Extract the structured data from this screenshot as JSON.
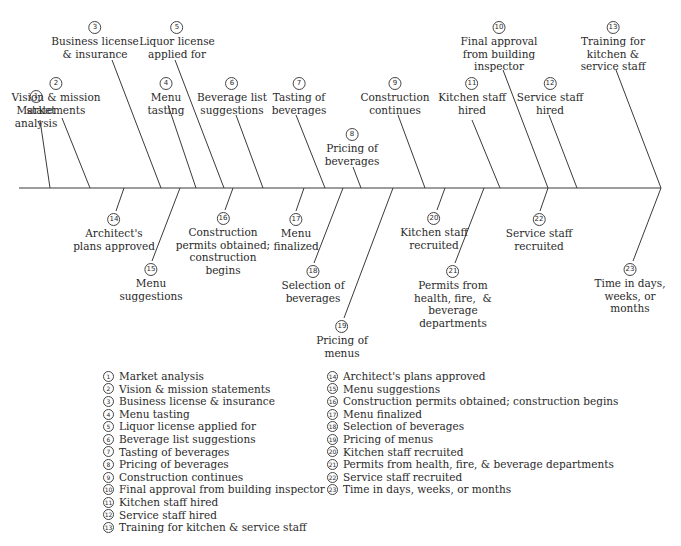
{
  "chart_data": {
    "type": "fishbone-timeline",
    "spine": {
      "x1": 19,
      "x2": 661,
      "y": 188
    },
    "upper_items": [
      {
        "n": "1",
        "label": "Market\nanalysis",
        "lx": 36,
        "ly": 90,
        "x1": 40,
        "y1": 120,
        "x2": 50,
        "y2": 188
      },
      {
        "n": "2",
        "label": "Vision & mission\nstatements",
        "lx": 56,
        "ly": 77,
        "x1": 62,
        "y1": 118,
        "x2": 90,
        "y2": 188
      },
      {
        "n": "3",
        "label": "Business license\n& insurance",
        "lx": 95,
        "ly": 21,
        "x1": 112,
        "y1": 60,
        "x2": 161,
        "y2": 188
      },
      {
        "n": "4",
        "label": "Menu\ntasting",
        "lx": 166,
        "ly": 77,
        "x1": 168,
        "y1": 105,
        "x2": 196,
        "y2": 188
      },
      {
        "n": "5",
        "label": "Liquor license\napplied for",
        "lx": 177,
        "ly": 21,
        "x1": 175,
        "y1": 60,
        "x2": 224,
        "y2": 188
      },
      {
        "n": "6",
        "label": "Beverage list\nsuggestions",
        "lx": 232,
        "ly": 77,
        "x1": 236,
        "y1": 115,
        "x2": 263,
        "y2": 188
      },
      {
        "n": "7",
        "label": "Tasting of\nbeverages",
        "lx": 299,
        "ly": 77,
        "x1": 296,
        "y1": 115,
        "x2": 325,
        "y2": 188
      },
      {
        "n": "8",
        "label": "Pricing of\nbeverages",
        "lx": 352,
        "ly": 128,
        "x1": 353,
        "y1": 167,
        "x2": 361,
        "y2": 188
      },
      {
        "n": "9",
        "label": "Construction\ncontinues",
        "lx": 395,
        "ly": 77,
        "x1": 398,
        "y1": 115,
        "x2": 425,
        "y2": 188
      },
      {
        "n": "11",
        "label": "Kitchen staff\nhired",
        "lx": 472,
        "ly": 77,
        "x1": 472,
        "y1": 120,
        "x2": 500,
        "y2": 188
      },
      {
        "n": "10",
        "label": "Final approval\nfrom building\ninspector",
        "lx": 499,
        "ly": 21,
        "x1": 503,
        "y1": 70,
        "x2": 548,
        "y2": 188
      },
      {
        "n": "12",
        "label": "Service staff\nhired",
        "lx": 550,
        "ly": 77,
        "x1": 549,
        "y1": 115,
        "x2": 577,
        "y2": 188
      },
      {
        "n": "13",
        "label": "Training for\nkitchen &\nservice staff",
        "lx": 613,
        "ly": 21,
        "x1": 616,
        "y1": 70,
        "x2": 661,
        "y2": 188
      }
    ],
    "lower_items": [
      {
        "n": "14",
        "label": "Architect's\nplans approved",
        "lx": 114,
        "ly": 213,
        "x1": 124,
        "y1": 188,
        "x2": 116,
        "y2": 211
      },
      {
        "n": "15",
        "label": "Menu\nsuggestions",
        "lx": 151,
        "ly": 263,
        "x1": 180,
        "y1": 188,
        "x2": 152,
        "y2": 261
      },
      {
        "n": "16",
        "label": "Construction\npermits obtained;\nconstruction\nbegins",
        "lx": 223,
        "ly": 212,
        "x1": 233,
        "y1": 188,
        "x2": 225,
        "y2": 210
      },
      {
        "n": "17",
        "label": "Menu\nfinalized",
        "lx": 296,
        "ly": 213,
        "x1": 304,
        "y1": 188,
        "x2": 296,
        "y2": 211
      },
      {
        "n": "18",
        "label": "Selection of\nbeverages",
        "lx": 313,
        "ly": 265,
        "x1": 343,
        "y1": 188,
        "x2": 314,
        "y2": 263
      },
      {
        "n": "19",
        "label": "Pricing of\nmenus",
        "lx": 342,
        "ly": 320,
        "x1": 393,
        "y1": 188,
        "x2": 344,
        "y2": 318
      },
      {
        "n": "20",
        "label": "Kitchen staff\nrecruited",
        "lx": 434,
        "ly": 212,
        "x1": 445,
        "y1": 188,
        "x2": 437,
        "y2": 210
      },
      {
        "n": "21",
        "label": "Permits from\nhealth, fire,  &\nbeverage\ndepartments",
        "lx": 453,
        "ly": 265,
        "x1": 484,
        "y1": 188,
        "x2": 455,
        "y2": 263
      },
      {
        "n": "22",
        "label": "Service staff\nrecruited",
        "lx": 539,
        "ly": 213,
        "x1": 548,
        "y1": 188,
        "x2": 540,
        "y2": 211
      },
      {
        "n": "23",
        "label": "Time in days,\nweeks, or\nmonths",
        "lx": 630,
        "ly": 263,
        "x1": 661,
        "y1": 188,
        "x2": 633,
        "y2": 261
      }
    ]
  },
  "legend": {
    "left": [
      {
        "n": "1",
        "text": "Market analysis"
      },
      {
        "n": "2",
        "text": "Vision & mission statements"
      },
      {
        "n": "3",
        "text": "Business license & insurance"
      },
      {
        "n": "4",
        "text": "Menu tasting"
      },
      {
        "n": "5",
        "text": "Liquor license applied for"
      },
      {
        "n": "6",
        "text": "Beverage list suggestions"
      },
      {
        "n": "7",
        "text": "Tasting of beverages"
      },
      {
        "n": "8",
        "text": "Pricing of beverages"
      },
      {
        "n": "9",
        "text": "Construction continues"
      },
      {
        "n": "10",
        "text": "Final approval from building inspector"
      },
      {
        "n": "11",
        "text": "Kitchen staff hired"
      },
      {
        "n": "12",
        "text": "Service staff hired"
      },
      {
        "n": "13",
        "text": "Training for kitchen & service staff"
      }
    ],
    "right": [
      {
        "n": "14",
        "text": "Architect's plans approved"
      },
      {
        "n": "15",
        "text": "Menu suggestions"
      },
      {
        "n": "16",
        "text": "Construction permits obtained; construction begins"
      },
      {
        "n": "17",
        "text": "Menu finalized"
      },
      {
        "n": "18",
        "text": "Selection of beverages"
      },
      {
        "n": "19",
        "text": "Pricing of menus"
      },
      {
        "n": "20",
        "text": "Kitchen staff recruited"
      },
      {
        "n": "21",
        "text": "Permits from health, fire, & beverage departments"
      },
      {
        "n": "22",
        "text": "Service staff recruited"
      },
      {
        "n": "23",
        "text": "Time in days, weeks, or months"
      }
    ]
  }
}
